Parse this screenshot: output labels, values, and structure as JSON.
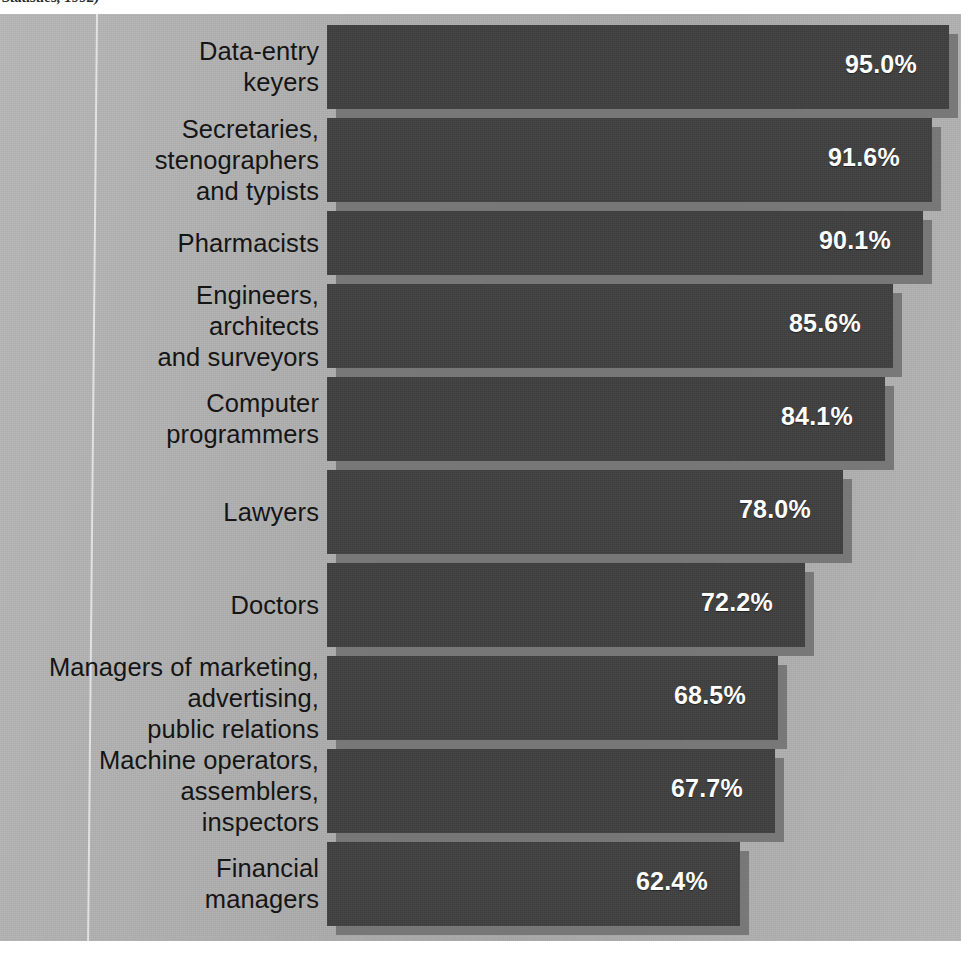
{
  "source_note": "Statistics, 1992)",
  "chart_data": {
    "type": "bar",
    "orientation": "horizontal",
    "title": "",
    "subtitle": "",
    "xlabel": "",
    "ylabel": "",
    "xlim": [
      0,
      100
    ],
    "grid": false,
    "legend": null,
    "value_suffix": "%",
    "colors": {
      "background": "#b2b2b2",
      "bar_fill": "#3f3f3f",
      "bar_shadow": "#6e6e6e",
      "value_text": "#ffffff",
      "label_text": "#151515",
      "rule": "#ffffff"
    },
    "categories": [
      "Data-entry\nkeyers",
      "Secretaries,\nstenographers\nand typists",
      "Pharmacists",
      "Engineers,\narchitects\nand surveyors",
      "Computer\nprogrammers",
      "Lawyers",
      "Doctors",
      "Managers of marketing,\nadvertising,\npublic relations",
      "Machine operators,\nassemblers,\ninspectors",
      "Financial\nmanagers"
    ],
    "values": [
      95.0,
      91.6,
      90.1,
      85.6,
      84.1,
      78.0,
      72.2,
      68.5,
      67.7,
      62.4
    ],
    "value_labels": [
      "95.0%",
      "91.6%",
      "90.1%",
      "85.6%",
      "84.1%",
      "78.0%",
      "72.2%",
      "68.5%",
      "67.7%",
      "62.4%"
    ]
  },
  "bars": [
    {
      "label": "Data-entry\nkeyers",
      "value_label": "95.0%",
      "top": 11,
      "height": 84,
      "width": 622
    },
    {
      "label": "Secretaries,\nstenographers\nand typists",
      "value_label": "91.6%",
      "top": 104,
      "height": 84,
      "width": 605
    },
    {
      "label": "Pharmacists",
      "value_label": "90.1%",
      "top": 197,
      "height": 64,
      "width": 596
    },
    {
      "label": "Engineers,\narchitects\nand surveyors",
      "value_label": "85.6%",
      "top": 270,
      "height": 84,
      "width": 566
    },
    {
      "label": "Computer\nprogrammers",
      "value_label": "84.1%",
      "top": 363,
      "height": 84,
      "width": 558
    },
    {
      "label": "Lawyers",
      "value_label": "78.0%",
      "top": 456,
      "height": 84,
      "width": 516
    },
    {
      "label": "Doctors",
      "value_label": "72.2%",
      "top": 549,
      "height": 84,
      "width": 478
    },
    {
      "label": "Managers of marketing,\nadvertising,\npublic relations",
      "value_label": "68.5%",
      "top": 642,
      "height": 84,
      "width": 451
    },
    {
      "label": "Machine operators,\nassemblers,\ninspectors",
      "value_label": "67.7%",
      "top": 735,
      "height": 84,
      "width": 448
    },
    {
      "label": "Financial\nmanagers",
      "value_label": "62.4%",
      "top": 828,
      "height": 84,
      "width": 413
    }
  ]
}
